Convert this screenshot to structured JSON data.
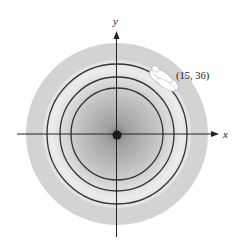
{
  "figure": {
    "type": "contour-field-diagram",
    "axes": {
      "x_label": "x",
      "y_label": "y"
    },
    "origin_marker": "filled-dot",
    "contour_circles_count": 3,
    "annotation": {
      "label": "(15, 36)",
      "marker": "white-elliptical-blob"
    },
    "colors": {
      "background": "#ffffff",
      "outer_disk": "#d2d2d2",
      "light_ring": "#e8e8e8",
      "center_dark": "#8a8a8a",
      "lines": "#333333"
    }
  }
}
